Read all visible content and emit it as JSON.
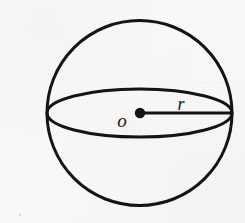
{
  "figure": {
    "name": "sphere-with-radius",
    "caption": "",
    "background_color": "#fbfbfa",
    "ink_color": "#141414"
  },
  "labels": {
    "center_label": "o",
    "radius_label": "r"
  },
  "geometry": {
    "canvas": {
      "width": 245,
      "height": 223
    },
    "sphere_circle": {
      "name": "sphere-outline",
      "cx": 139.5,
      "cy": 113,
      "r": 92.5,
      "stroke_width": 3.0,
      "fill": "none"
    },
    "equator_ellipse": {
      "name": "equator-ellipse",
      "cx": 139.5,
      "cy": 113,
      "rx": 92.5,
      "ry": 24,
      "stroke_width": 3.0,
      "fill": "none"
    },
    "center_point": {
      "name": "center-point",
      "cx": 140,
      "cy": 113,
      "r": 5.2
    },
    "radius_segment": {
      "name": "radius-line",
      "x1": 140,
      "y1": 113,
      "x2": 232,
      "y2": 113,
      "stroke_width": 3.0
    },
    "center_label_pos": {
      "x": 122,
      "y": 127,
      "font_size": 19
    },
    "radius_label_pos": {
      "x": 176,
      "y": 110,
      "font_size": 18
    },
    "speck": {
      "cx": 20,
      "cy": 215,
      "r": 1.1
    }
  }
}
